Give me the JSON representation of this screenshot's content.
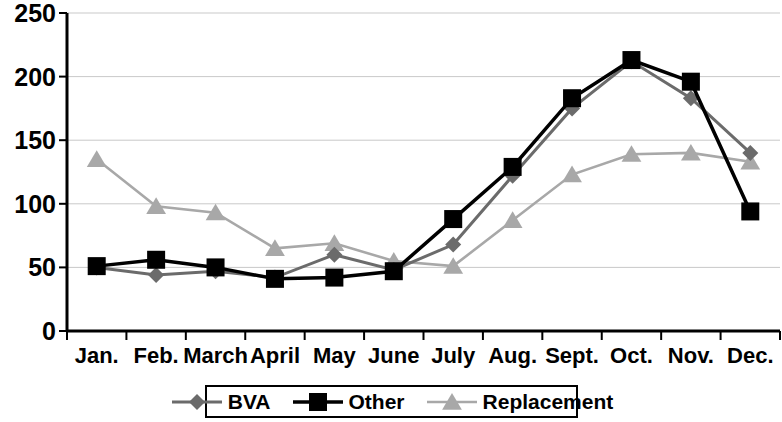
{
  "chart_data": {
    "type": "line",
    "title": "",
    "xlabel": "",
    "ylabel": "",
    "categories": [
      "Jan.",
      "Feb.",
      "March",
      "April",
      "May",
      "June",
      "July",
      "Aug.",
      "Sept.",
      "Oct.",
      "Nov.",
      "Dec."
    ],
    "ylim": [
      0,
      250
    ],
    "yticks": [
      0,
      50,
      100,
      150,
      200,
      250
    ],
    "ytick_labels": [
      "0",
      "50",
      "100",
      "150",
      "200",
      "250"
    ],
    "grid": true,
    "grid_axis": "y",
    "legend_position": "bottom",
    "series": [
      {
        "name": "BVA",
        "color": "#6b6b6b",
        "marker": "diamond",
        "values": [
          50,
          44,
          47,
          42,
          60,
          48,
          68,
          122,
          175,
          212,
          183,
          140
        ]
      },
      {
        "name": "Other",
        "color": "#000000",
        "marker": "square",
        "values": [
          51,
          56,
          50,
          41,
          42,
          47,
          88,
          129,
          183,
          213,
          196,
          94
        ]
      },
      {
        "name": "Replacement",
        "color": "#a8a8a8",
        "marker": "triangle",
        "values": [
          135,
          98,
          93,
          65,
          69,
          55,
          51,
          87,
          123,
          139,
          140,
          133
        ]
      }
    ]
  },
  "axes": {
    "y_labels": [
      "250",
      "200",
      "150",
      "100",
      "50",
      "0"
    ],
    "x_labels": [
      "Jan.",
      "Feb.",
      "March",
      "April",
      "May",
      "June",
      "July",
      "Aug.",
      "Sept.",
      "Oct.",
      "Nov.",
      "Dec."
    ]
  },
  "legend": {
    "items": [
      {
        "label": "BVA",
        "marker": "diamond",
        "color": "#6b6b6b"
      },
      {
        "label": "Other",
        "marker": "square",
        "color": "#000000"
      },
      {
        "label": "Replacement",
        "marker": "triangle",
        "color": "#a8a8a8"
      }
    ]
  }
}
